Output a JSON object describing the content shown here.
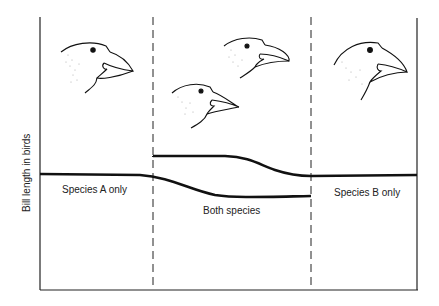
{
  "diagram": {
    "y_axis_label": "Bill length in birds",
    "regions": [
      {
        "id": "a",
        "label": "Species A only"
      },
      {
        "id": "both",
        "label": "Both species"
      },
      {
        "id": "b",
        "label": "Species B only"
      }
    ],
    "birds": [
      {
        "region": "Species A only",
        "bill": "medium"
      },
      {
        "region": "Both species",
        "bill": "long-narrow (upper)"
      },
      {
        "region": "Both species",
        "bill": "short-deep (lower)"
      },
      {
        "region": "Species B only",
        "bill": "medium"
      }
    ],
    "line_color": "#111111"
  }
}
